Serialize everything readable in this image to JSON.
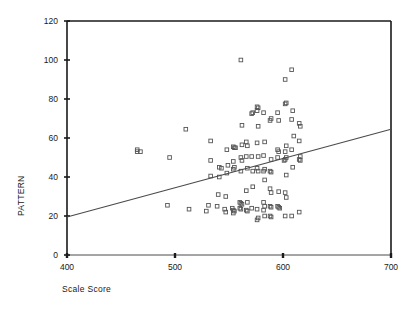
{
  "chart_data": {
    "type": "scatter",
    "title": "",
    "xlabel": "Scale Score",
    "ylabel": "PATTERN",
    "xlim": [
      400,
      700
    ],
    "ylim": [
      0,
      120
    ],
    "xticks": [
      400,
      500,
      600,
      700
    ],
    "yticks": [
      0,
      20,
      40,
      60,
      80,
      100,
      120
    ],
    "grid": false,
    "legend": null,
    "marker_style": "open-square",
    "marker_color": "#555555",
    "line_color": "#4a4a4a",
    "axis_color": "#1a1a1a",
    "trend_line": {
      "name": "regression line",
      "x_start": 400,
      "y_start": 19.5,
      "x_end": 700,
      "y_end": 64.5,
      "slope": 0.15,
      "intercept": -40.5
    },
    "points": [
      [
        465,
        54
      ],
      [
        465,
        53
      ],
      [
        468,
        53
      ],
      [
        495,
        50
      ],
      [
        493,
        25.5
      ],
      [
        510,
        64.5
      ],
      [
        513,
        23.5
      ],
      [
        533,
        58.5
      ],
      [
        533,
        48.5
      ],
      [
        533,
        40.5
      ],
      [
        531,
        25.5
      ],
      [
        529,
        22.5
      ],
      [
        541,
        45
      ],
      [
        543,
        44.5
      ],
      [
        541,
        40
      ],
      [
        540,
        31
      ],
      [
        539,
        25
      ],
      [
        548,
        54
      ],
      [
        549,
        46
      ],
      [
        548,
        42
      ],
      [
        547,
        30
      ],
      [
        546,
        23.5
      ],
      [
        547,
        22
      ],
      [
        554,
        55.5
      ],
      [
        555,
        55
      ],
      [
        556,
        55
      ],
      [
        554,
        48
      ],
      [
        555,
        45
      ],
      [
        554,
        44
      ],
      [
        553,
        24
      ],
      [
        554,
        23
      ],
      [
        555,
        22.5
      ],
      [
        554,
        21.5
      ],
      [
        561,
        100
      ],
      [
        562,
        66.5
      ],
      [
        562,
        56.5
      ],
      [
        561,
        50
      ],
      [
        562,
        48.5
      ],
      [
        561,
        43
      ],
      [
        560,
        27
      ],
      [
        561,
        26.5
      ],
      [
        562,
        26
      ],
      [
        560,
        24
      ],
      [
        561,
        23.5
      ],
      [
        566,
        58
      ],
      [
        567,
        56
      ],
      [
        566,
        50.5
      ],
      [
        567,
        44.5
      ],
      [
        566,
        33
      ],
      [
        567,
        27
      ],
      [
        566,
        23
      ],
      [
        567,
        22.5
      ],
      [
        571,
        72.5
      ],
      [
        572,
        73
      ],
      [
        571,
        50.5
      ],
      [
        572,
        43
      ],
      [
        572,
        35
      ],
      [
        571,
        24
      ],
      [
        576,
        76
      ],
      [
        577,
        75.5
      ],
      [
        576,
        74
      ],
      [
        577,
        66
      ],
      [
        576,
        57.5
      ],
      [
        577,
        50.5
      ],
      [
        576,
        44.5
      ],
      [
        577,
        43
      ],
      [
        576,
        23.5
      ],
      [
        577,
        19
      ],
      [
        576,
        18
      ],
      [
        582,
        73
      ],
      [
        583,
        58
      ],
      [
        582,
        51
      ],
      [
        583,
        44
      ],
      [
        582,
        43
      ],
      [
        583,
        38.5
      ],
      [
        582,
        27
      ],
      [
        583,
        25
      ],
      [
        582,
        23
      ],
      [
        583,
        20
      ],
      [
        589,
        70
      ],
      [
        588,
        69
      ],
      [
        589,
        49
      ],
      [
        588,
        43
      ],
      [
        589,
        42.5
      ],
      [
        588,
        34
      ],
      [
        589,
        32
      ],
      [
        588,
        25
      ],
      [
        589,
        24.5
      ],
      [
        588,
        20
      ],
      [
        589,
        19.5
      ],
      [
        595,
        73
      ],
      [
        596,
        69
      ],
      [
        595,
        54
      ],
      [
        596,
        53
      ],
      [
        595,
        50
      ],
      [
        596,
        32.5
      ],
      [
        595,
        25
      ],
      [
        596,
        24.5
      ],
      [
        597,
        24
      ],
      [
        602,
        90
      ],
      [
        603,
        78
      ],
      [
        602,
        77.5
      ],
      [
        603,
        56
      ],
      [
        602,
        53
      ],
      [
        603,
        50
      ],
      [
        602,
        49
      ],
      [
        601,
        48.5
      ],
      [
        603,
        41
      ],
      [
        602,
        32
      ],
      [
        603,
        29.5
      ],
      [
        602,
        20
      ],
      [
        608,
        95
      ],
      [
        609,
        74
      ],
      [
        608,
        69.5
      ],
      [
        610,
        61
      ],
      [
        608,
        54
      ],
      [
        609,
        45
      ],
      [
        608,
        20
      ],
      [
        615,
        67.5
      ],
      [
        616,
        66
      ],
      [
        615,
        58.5
      ],
      [
        616,
        50.5
      ],
      [
        615,
        49
      ],
      [
        616,
        48.5
      ],
      [
        615,
        22
      ]
    ]
  },
  "axes": {
    "y_tick_labels": [
      "0",
      "20",
      "40",
      "60",
      "80",
      "100",
      "120"
    ],
    "x_tick_labels": [
      "400",
      "500",
      "600",
      "700"
    ],
    "y_axis_title": "PATTERN",
    "x_axis_title": "Scale Score"
  }
}
